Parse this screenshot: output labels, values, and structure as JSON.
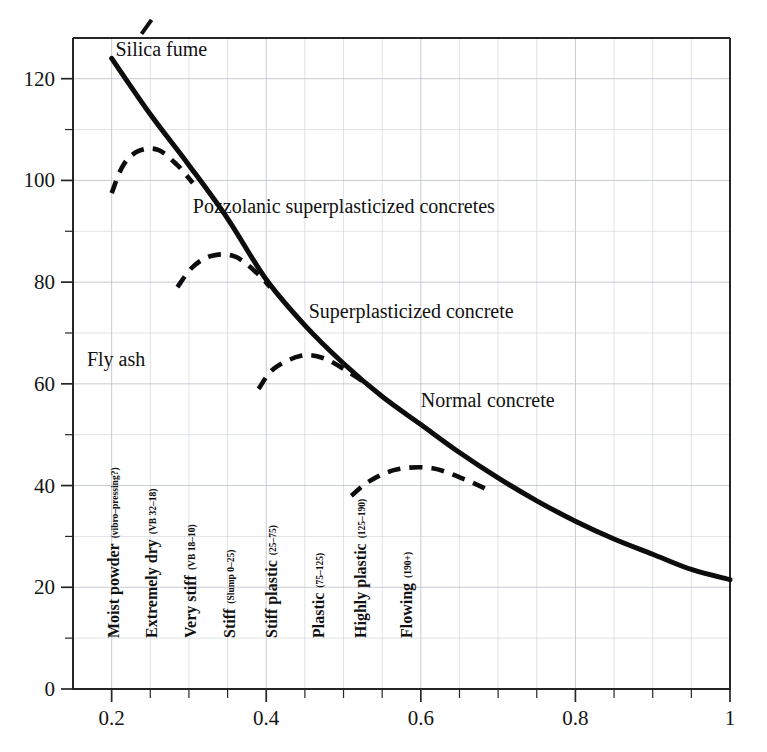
{
  "chart_data": {
    "type": "line",
    "title": "",
    "xlabel": "",
    "ylabel": "",
    "xlim": [
      0.15,
      1.0
    ],
    "ylim": [
      0,
      128
    ],
    "grid": true,
    "legend_position": "inline-annotations",
    "x_ticks": [
      "0.2",
      "0.4",
      "0.6",
      "0.8",
      "1"
    ],
    "x_tick_values": [
      0.2,
      0.4,
      0.6,
      0.8,
      1.0
    ],
    "x_minor_tick_values": [
      0.25,
      0.3,
      0.35,
      0.45,
      0.5,
      0.55,
      0.65,
      0.7,
      0.75,
      0.85,
      0.9,
      0.95
    ],
    "y_ticks": [
      "0",
      "20",
      "40",
      "60",
      "80",
      "100",
      "120"
    ],
    "y_tick_values": [
      0,
      20,
      40,
      60,
      80,
      100,
      120
    ],
    "y_minor_tick_values": [
      10,
      30,
      50,
      70,
      90,
      110
    ],
    "series": [
      {
        "name": "Normal concrete",
        "style": "solid",
        "points": [
          [
            0.2,
            124.0
          ],
          [
            0.25,
            113.0
          ],
          [
            0.3,
            103.0
          ],
          [
            0.35,
            92.5
          ],
          [
            0.4,
            80.5
          ],
          [
            0.45,
            71.5
          ],
          [
            0.5,
            64.0
          ],
          [
            0.55,
            57.5
          ],
          [
            0.6,
            52.0
          ],
          [
            0.65,
            46.5
          ],
          [
            0.7,
            41.5
          ],
          [
            0.75,
            37.0
          ],
          [
            0.8,
            33.0
          ],
          [
            0.85,
            29.5
          ],
          [
            0.9,
            26.5
          ],
          [
            0.95,
            23.5
          ],
          [
            1.0,
            21.5
          ]
        ]
      },
      {
        "name": "Silica fume branch",
        "style": "dashed",
        "points": [
          [
            0.2,
            97.5
          ],
          [
            0.215,
            103.0
          ],
          [
            0.235,
            105.8
          ],
          [
            0.26,
            106.0
          ],
          [
            0.285,
            103.0
          ],
          [
            0.305,
            99.5
          ]
        ]
      },
      {
        "name": "Pozzolanic superplasticized branch",
        "style": "dashed",
        "points": [
          [
            0.285,
            79.0
          ],
          [
            0.305,
            83.0
          ],
          [
            0.33,
            85.2
          ],
          [
            0.36,
            85.0
          ],
          [
            0.39,
            81.5
          ],
          [
            0.405,
            79.0
          ]
        ]
      },
      {
        "name": "Superplasticized branch",
        "style": "dashed",
        "points": [
          [
            0.39,
            59.0
          ],
          [
            0.41,
            63.0
          ],
          [
            0.445,
            65.5
          ],
          [
            0.475,
            65.0
          ],
          [
            0.51,
            62.0
          ],
          [
            0.525,
            60.5
          ]
        ]
      },
      {
        "name": "Highly plastic branch",
        "style": "dashed",
        "points": [
          [
            0.51,
            38.0
          ],
          [
            0.535,
            41.0
          ],
          [
            0.57,
            43.2
          ],
          [
            0.615,
            43.4
          ],
          [
            0.66,
            41.0
          ],
          [
            0.69,
            38.9
          ]
        ]
      }
    ],
    "annotations": [
      {
        "id": "silica-fume",
        "text": "Silica fume",
        "x": 0.205,
        "y": 124.5,
        "pointer": true
      },
      {
        "id": "pozzolanic",
        "text": "Pozzolanic superplasticized concretes",
        "x": 0.305,
        "y": 93.5,
        "pointer": false
      },
      {
        "id": "superplasticized",
        "text": "Superplasticized concrete",
        "x": 0.455,
        "y": 73.0,
        "pointer": false
      },
      {
        "id": "fly-ash",
        "text": "Fly ash",
        "x": 0.168,
        "y": 63.5,
        "pointer": false
      },
      {
        "id": "normal-concrete",
        "text": "Normal concrete",
        "x": 0.6,
        "y": 55.5,
        "pointer": false
      }
    ],
    "category_labels": [
      {
        "id": "moist-powder",
        "main": "Moist powder",
        "sub": "(vibro–pressing?)",
        "x": 0.2
      },
      {
        "id": "extremely-dry",
        "main": "Extremely dry",
        "sub": "(VB 32–18)",
        "x": 0.25
      },
      {
        "id": "very-stiff",
        "main": "Very stiff",
        "sub": "(VB 18–10)",
        "x": 0.3
      },
      {
        "id": "stiff",
        "main": "Stiff",
        "sub": "(Slump 0–25)",
        "x": 0.35
      },
      {
        "id": "stiff-plastic",
        "main": "Stiff plastic",
        "sub": "(25–75)",
        "x": 0.405
      },
      {
        "id": "plastic",
        "main": "Plastic",
        "sub": "(75–125)",
        "x": 0.465
      },
      {
        "id": "highly-plastic",
        "main": "Highly plastic",
        "sub": "(125–190)",
        "x": 0.52
      },
      {
        "id": "flowing",
        "main": "Flowing",
        "sub": "(190+)",
        "x": 0.58
      }
    ],
    "colors": {
      "curve": "#0d0d0d",
      "grid": "#b9bec6",
      "frame": "#262626",
      "text": "#111111",
      "background": "#ffffff"
    }
  }
}
